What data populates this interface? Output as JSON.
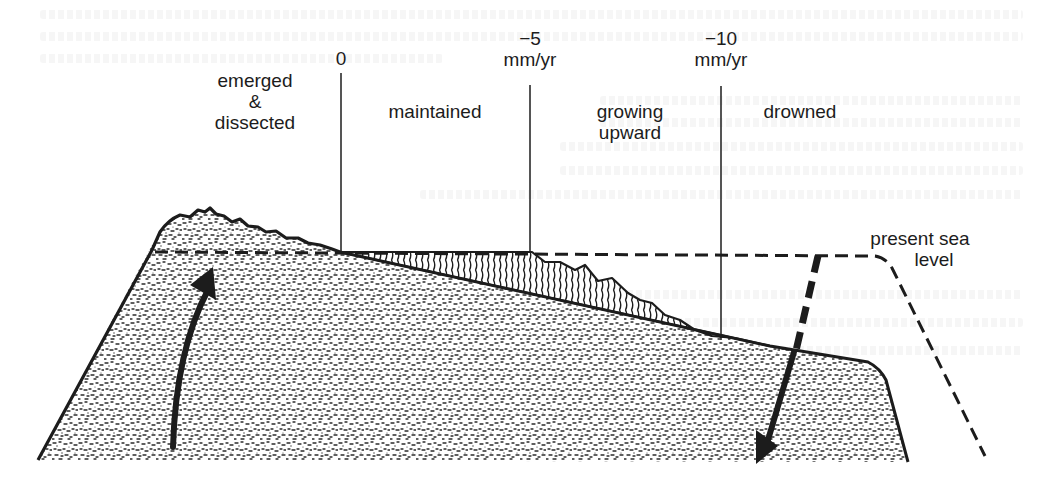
{
  "figure": {
    "type": "reef subsidence cross-section diagram",
    "zones": [
      {
        "label_lines": [
          "emerged",
          "&",
          "dissected"
        ],
        "name": "emerged-dissected"
      },
      {
        "label_lines": [
          "maintained"
        ],
        "name": "maintained"
      },
      {
        "label_lines": [
          "growing",
          "upward"
        ],
        "name": "growing-upward"
      },
      {
        "label_lines": [
          "drowned"
        ],
        "name": "drowned"
      }
    ],
    "boundaries": [
      {
        "value": "0",
        "unit": ""
      },
      {
        "value": "−5",
        "unit": "mm/yr"
      },
      {
        "value": "−10",
        "unit": "mm/yr"
      }
    ],
    "sea_level_label": [
      "present sea",
      "level"
    ],
    "arrows": [
      {
        "name": "uplift-arrow",
        "direction": "up"
      },
      {
        "name": "subsidence-arrow",
        "direction": "down"
      }
    ]
  },
  "colors": {
    "ink": "#1c1c1c",
    "paper": "#ffffff",
    "bleed_text": "#e6e6e6"
  }
}
